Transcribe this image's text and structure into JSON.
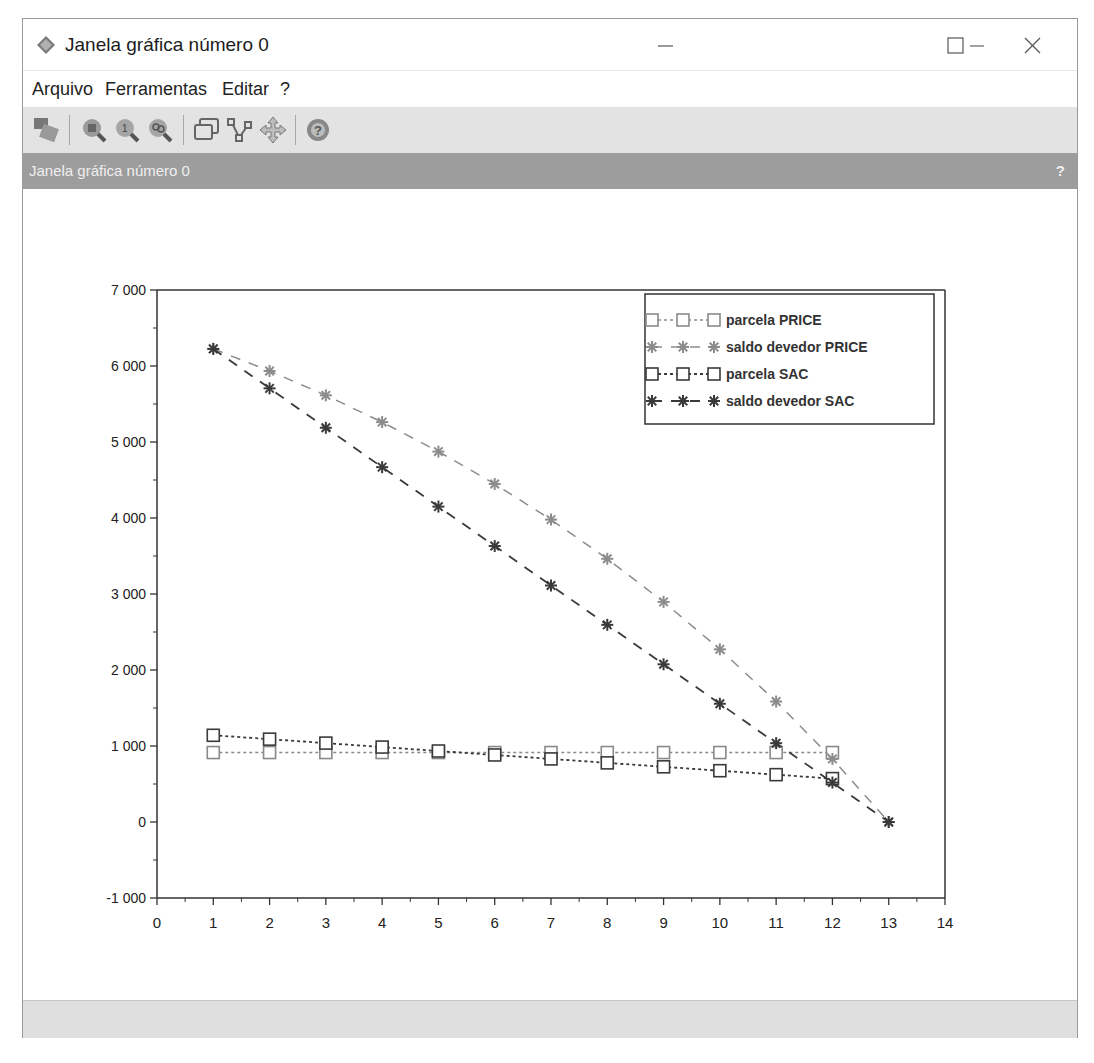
{
  "window": {
    "title": "Janela gráfica número 0",
    "controls": {
      "minimize": "—",
      "maximize": "☐",
      "close": "✕"
    }
  },
  "menu": {
    "items": [
      {
        "label": "Arquivo"
      },
      {
        "label": "Ferramentas"
      },
      {
        "label": "Editar"
      },
      {
        "label": "?"
      }
    ]
  },
  "toolbar": {
    "buttons": [
      {
        "icon": "select-icon"
      },
      {
        "icon": "zoom-in-icon"
      },
      {
        "icon": "zoom-reset-icon"
      },
      {
        "icon": "zoom-out-icon"
      },
      {
        "icon": "datatip-icon"
      },
      {
        "icon": "edit-curve-icon"
      },
      {
        "icon": "rotate-icon"
      },
      {
        "icon": "help-icon"
      }
    ]
  },
  "dock": {
    "title": "Janela gráfica número 0",
    "help": "?"
  },
  "colors": {
    "price_saldo": "#8c8c8c",
    "sac_saldo": "#3a3a3a",
    "price_parcela": "#8a8a8a",
    "sac_parcela": "#3a3a3a",
    "axis": "#333333",
    "dockbar": "#9d9d9d"
  },
  "chart_data": {
    "type": "line",
    "title": "",
    "xlabel": "",
    "ylabel": "",
    "xlim": [
      0,
      14
    ],
    "ylim": [
      -1000,
      7000
    ],
    "x_ticks": [
      "0",
      "1",
      "2",
      "3",
      "4",
      "5",
      "6",
      "7",
      "8",
      "9",
      "10",
      "11",
      "12",
      "13",
      "14"
    ],
    "y_ticks": [
      "-1 000",
      "0",
      "1 000",
      "2 000",
      "3 000",
      "4 000",
      "5 000",
      "6 000",
      "7 000"
    ],
    "grid": false,
    "legend_position": "upper right",
    "x": [
      1,
      2,
      3,
      4,
      5,
      6,
      7,
      8,
      9,
      10,
      11,
      12,
      13
    ],
    "series": [
      {
        "name": "parcela PRICE",
        "marker": "square",
        "line": "dotted",
        "x": [
          1,
          2,
          3,
          4,
          5,
          6,
          7,
          8,
          9,
          10,
          11,
          12
        ],
        "values": [
          914,
          914,
          914,
          914,
          914,
          914,
          914,
          914,
          914,
          914,
          914,
          914
        ]
      },
      {
        "name": "saldo devedor PRICE",
        "marker": "asterisk",
        "line": "dashed",
        "x": [
          1,
          2,
          3,
          4,
          5,
          6,
          7,
          8,
          9,
          10,
          11,
          12,
          13
        ],
        "values": [
          6225,
          5934,
          5614,
          5262,
          4874,
          4448,
          3979,
          3463,
          2896,
          2272,
          1585,
          830,
          0
        ]
      },
      {
        "name": "parcela SAC",
        "marker": "square",
        "line": "dotted",
        "x": [
          1,
          2,
          3,
          4,
          5,
          6,
          7,
          8,
          9,
          10,
          11,
          12
        ],
        "values": [
          1141,
          1090,
          1038,
          986,
          934,
          882,
          830,
          778,
          726,
          675,
          623,
          571
        ]
      },
      {
        "name": "saldo devedor SAC",
        "marker": "asterisk",
        "line": "dashed",
        "x": [
          1,
          2,
          3,
          4,
          5,
          6,
          7,
          8,
          9,
          10,
          11,
          12,
          13
        ],
        "values": [
          6225,
          5706,
          5187,
          4669,
          4150,
          3631,
          3112,
          2594,
          2075,
          1556,
          1037,
          519,
          0
        ]
      }
    ]
  }
}
